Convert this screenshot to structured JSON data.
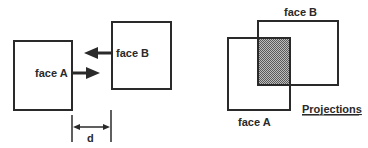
{
  "diagram": {
    "left_panel": {
      "face_a_label": "face A",
      "face_b_label": "face B",
      "distance_label": "d"
    },
    "right_panel": {
      "face_a_label": "face A",
      "face_b_label": "face B",
      "caption": "Projections"
    },
    "colors": {
      "stroke": "#2a2a2a",
      "overlap_fill": "#8a8a8a",
      "background": "#ffffff"
    }
  }
}
